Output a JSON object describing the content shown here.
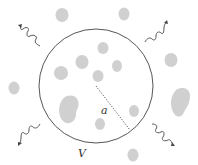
{
  "diagram": {
    "volume_label": "V",
    "radius_label": "a",
    "colors": {
      "boundary": "#555555",
      "particle": "#c8c8c8",
      "radiation": "#444444",
      "radius_line": "#444444"
    },
    "particles_inside_count": 8,
    "particles_outside_count": 6,
    "radiation_arrows": [
      "top-left",
      "top-right",
      "bottom-left",
      "bottom-right"
    ]
  }
}
